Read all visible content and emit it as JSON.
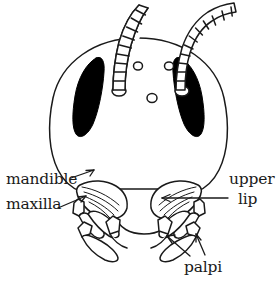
{
  "figure": {
    "background_color": "#ffffff",
    "ink_color": "#1a1a1a",
    "eye_fill_color": "#000000",
    "width": 277,
    "height": 288
  },
  "labels": [
    {
      "id": "mandible",
      "text": "mandible",
      "position": "left",
      "points_to": "left-mandible"
    },
    {
      "id": "maxilla",
      "text": "maxilla",
      "position": "left",
      "points_to": "left-maxilla"
    },
    {
      "id": "upper",
      "text": "upper",
      "position": "right",
      "points_to": "labrum"
    },
    {
      "id": "lip",
      "text": "lip",
      "position": "right",
      "points_to": "labrum"
    },
    {
      "id": "palpi",
      "text": "palpi",
      "position": "bottom-right",
      "points_to": "palps"
    }
  ],
  "anatomy": {
    "head_capsule": "rounded head capsule outline",
    "compound_eyes": 2,
    "ocelli": 3,
    "antennae": 2,
    "antenna_style": "segmented filiform",
    "mandibles": 2,
    "maxillae": 2,
    "labrum": "upper lip (labrum) shield",
    "palps": 4
  }
}
